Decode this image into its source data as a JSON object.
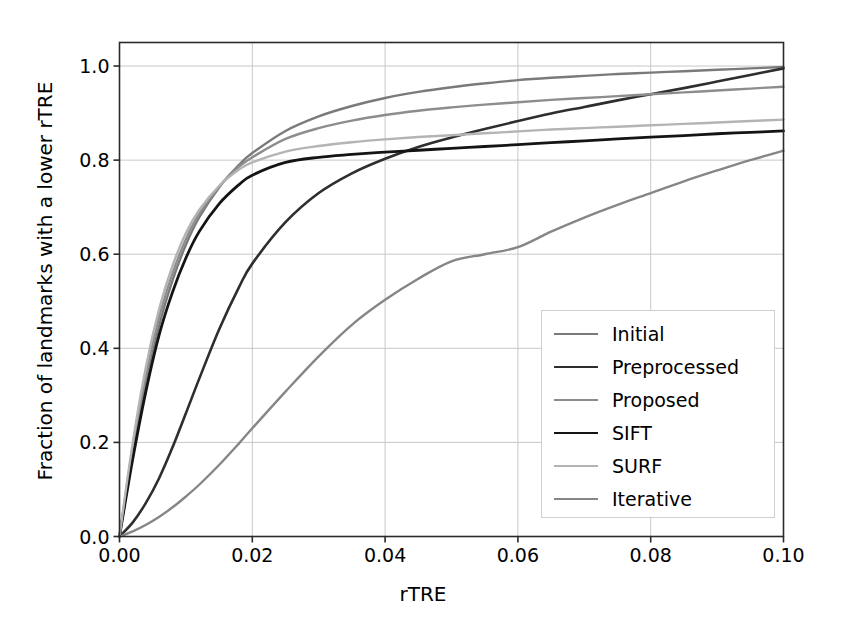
{
  "chart_data": {
    "type": "line",
    "title": "",
    "xlabel": "rTRE",
    "ylabel": "Fraction of landmarks with a lower rTRE",
    "xlim": [
      0.0,
      0.1
    ],
    "ylim": [
      0.0,
      1.05
    ],
    "xticks": [
      "0.00",
      "0.02",
      "0.04",
      "0.06",
      "0.08",
      "0.10"
    ],
    "xtick_values": [
      0.0,
      0.02,
      0.04,
      0.06,
      0.08,
      0.1
    ],
    "yticks": [
      "0.0",
      "0.2",
      "0.4",
      "0.6",
      "0.8",
      "1.0"
    ],
    "ytick_values": [
      0.0,
      0.2,
      0.4,
      0.6,
      0.8,
      1.0
    ],
    "grid": true,
    "legend_position": "lower right",
    "x": [
      0.0,
      0.002,
      0.004,
      0.006,
      0.008,
      0.01,
      0.012,
      0.015,
      0.018,
      0.02,
      0.025,
      0.03,
      0.035,
      0.04,
      0.045,
      0.05,
      0.055,
      0.06,
      0.065,
      0.07,
      0.075,
      0.08,
      0.085,
      0.09,
      0.095,
      0.1
    ],
    "series": [
      {
        "name": "Initial",
        "color": "#7a7a7a",
        "width": 2.4,
        "values": [
          0.0,
          0.175,
          0.325,
          0.45,
          0.545,
          0.62,
          0.678,
          0.742,
          0.79,
          0.815,
          0.862,
          0.893,
          0.915,
          0.932,
          0.945,
          0.955,
          0.963,
          0.97,
          0.975,
          0.979,
          0.983,
          0.986,
          0.989,
          0.992,
          0.995,
          0.998
        ]
      },
      {
        "name": "Preprocessed",
        "color": "#2e2e2e",
        "width": 2.6,
        "values": [
          0.0,
          0.03,
          0.072,
          0.125,
          0.19,
          0.262,
          0.335,
          0.44,
          0.53,
          0.58,
          0.668,
          0.73,
          0.772,
          0.803,
          0.828,
          0.848,
          0.866,
          0.883,
          0.899,
          0.913,
          0.927,
          0.94,
          0.953,
          0.967,
          0.981,
          0.995
        ]
      },
      {
        "name": "Proposed",
        "color": "#8d8d8d",
        "width": 2.4,
        "values": [
          0.0,
          0.19,
          0.345,
          0.468,
          0.56,
          0.632,
          0.686,
          0.744,
          0.786,
          0.806,
          0.845,
          0.868,
          0.884,
          0.896,
          0.905,
          0.912,
          0.918,
          0.923,
          0.928,
          0.932,
          0.936,
          0.94,
          0.944,
          0.948,
          0.952,
          0.956
        ]
      },
      {
        "name": "SIFT",
        "color": "#141414",
        "width": 2.8,
        "values": [
          0.0,
          0.165,
          0.31,
          0.43,
          0.52,
          0.592,
          0.648,
          0.707,
          0.748,
          0.768,
          0.795,
          0.806,
          0.812,
          0.817,
          0.821,
          0.825,
          0.829,
          0.833,
          0.837,
          0.841,
          0.845,
          0.849,
          0.852,
          0.856,
          0.859,
          0.862
        ]
      },
      {
        "name": "SURF",
        "color": "#b4b4b4",
        "width": 2.4,
        "values": [
          0.0,
          0.2,
          0.362,
          0.485,
          0.576,
          0.645,
          0.694,
          0.745,
          0.78,
          0.795,
          0.818,
          0.83,
          0.838,
          0.844,
          0.849,
          0.853,
          0.857,
          0.861,
          0.865,
          0.868,
          0.871,
          0.874,
          0.877,
          0.88,
          0.883,
          0.886
        ]
      },
      {
        "name": "Iterative",
        "color": "#868686",
        "width": 2.4,
        "values": [
          0.0,
          0.011,
          0.025,
          0.042,
          0.062,
          0.085,
          0.11,
          0.152,
          0.198,
          0.23,
          0.308,
          0.383,
          0.45,
          0.503,
          0.548,
          0.585,
          0.6,
          0.615,
          0.648,
          0.678,
          0.705,
          0.73,
          0.755,
          0.778,
          0.8,
          0.82
        ]
      }
    ]
  },
  "axes": {
    "spine_color": "#2a2a2a",
    "grid_color": "#c8c8c8",
    "background": "#ffffff"
  },
  "legend": {
    "border_color": "#cfcfcf",
    "entries": [
      {
        "label": "Initial"
      },
      {
        "label": "Preprocessed"
      },
      {
        "label": "Proposed"
      },
      {
        "label": "SIFT"
      },
      {
        "label": "SURF"
      },
      {
        "label": "Iterative"
      }
    ]
  }
}
